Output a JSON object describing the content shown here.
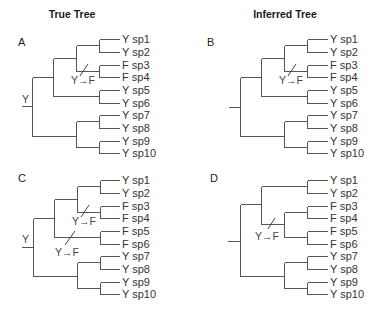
{
  "titles": {
    "true_tree": "True Tree",
    "inferred_tree": "Inferred Tree"
  },
  "leaves": [
    "sp1",
    "sp2",
    "sp3",
    "sp4",
    "sp5",
    "sp6",
    "sp7",
    "sp8",
    "sp9",
    "sp10"
  ],
  "transition_label": "Y→F",
  "panels": [
    {
      "id": "A",
      "label": "A",
      "root_state": "Y",
      "states": [
        "Y",
        "Y",
        "F",
        "F",
        "Y",
        "Y",
        "Y",
        "Y",
        "Y",
        "Y"
      ],
      "topology": "((((sp1,sp2),(sp3,sp4)),(sp5,sp6)),((sp7,sp8),(sp9,sp10)))",
      "transitions": [
        {
          "branch": "ancestor of sp3+sp4",
          "label": "Y→F"
        }
      ]
    },
    {
      "id": "B",
      "label": "B",
      "root_state": "",
      "states": [
        "Y",
        "Y",
        "F",
        "F",
        "Y",
        "Y",
        "Y",
        "Y",
        "Y",
        "Y"
      ],
      "topology": "((((sp1,sp2),(sp3,sp4)),(sp5,sp6)),((sp7,sp8),(sp9,sp10)))",
      "transitions": [
        {
          "branch": "ancestor of sp3+sp4",
          "label": "Y→F"
        }
      ]
    },
    {
      "id": "C",
      "label": "C",
      "root_state": "Y",
      "states": [
        "Y",
        "Y",
        "F",
        "F",
        "F",
        "F",
        "Y",
        "Y",
        "Y",
        "Y"
      ],
      "topology": "((((sp1,sp2),(sp3,sp4)),(sp5,sp6)),((sp7,sp8),(sp9,sp10)))",
      "transitions": [
        {
          "branch": "ancestor of sp3+sp4",
          "label": "Y→F"
        },
        {
          "branch": "ancestor of sp5+sp6",
          "label": "Y→F"
        }
      ]
    },
    {
      "id": "D",
      "label": "D",
      "root_state": "",
      "states": [
        "Y",
        "Y",
        "F",
        "F",
        "F",
        "F",
        "Y",
        "Y",
        "Y",
        "Y"
      ],
      "topology": "(((sp1,sp2),((sp3,sp4),(sp5,sp6))),((sp7,sp8),(sp9,sp10)))",
      "transitions": [
        {
          "branch": "ancestor of sp3+sp4+sp5+sp6",
          "label": "Y→F"
        }
      ]
    }
  ]
}
